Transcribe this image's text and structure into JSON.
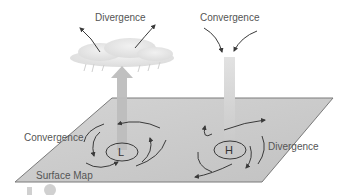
{
  "diagram": {
    "labels": {
      "upper_divergence": "Divergence",
      "upper_convergence": "Convergence",
      "surface_convergence": "Convergence",
      "surface_divergence": "Divergence",
      "surface_map": "Surface Map",
      "low_center": "L",
      "high_center": "H"
    },
    "features": [
      {
        "name": "low-pressure-system",
        "center": "L",
        "surface_flow": "convergence",
        "vertical_motion": "rising",
        "aloft": "divergence",
        "cloud": true
      },
      {
        "name": "high-pressure-system",
        "center": "H",
        "surface_flow": "divergence",
        "vertical_motion": "sinking",
        "aloft": "convergence",
        "cloud": false
      }
    ],
    "colors": {
      "plane_fill": "#c9c9c9",
      "plane_edge": "#7a7a7a",
      "rising_arrow": "#bdbdbd",
      "sinking_column": "#d2d2d2",
      "flow_arrows": "#3a3a3a",
      "cloud": "#e8e8e8",
      "text": "#555555"
    }
  }
}
